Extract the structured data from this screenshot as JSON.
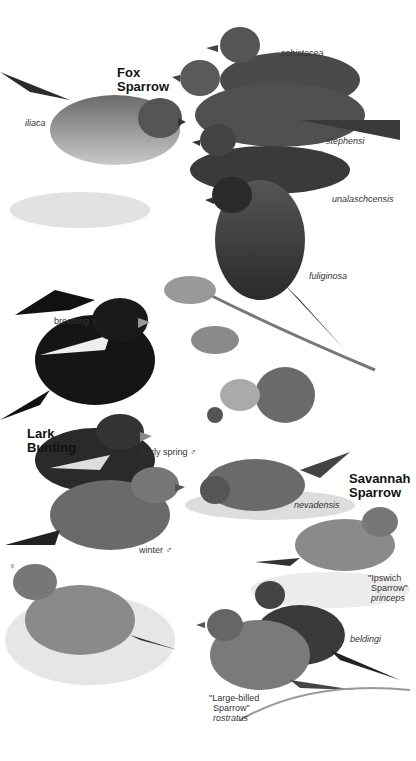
{
  "species": [
    {
      "name_line1": "Fox",
      "name_line2": "Sparrow",
      "subspecies": [
        "iliaca",
        "schistacea",
        "stephensi",
        "unalaschcensis",
        "fuliginosa"
      ]
    },
    {
      "name_line1": "Lark",
      "name_line2": "Bunting",
      "plumages": [
        "breeding ♂",
        "early spring ♂",
        "winter ♂",
        "♀"
      ]
    },
    {
      "name_line1": "Savannah",
      "name_line2": "Sparrow",
      "subspecies": [
        "nevadensis",
        "beldingi"
      ],
      "ipswich": {
        "line1": "\"Ipswich",
        "line2": "Sparrow\"",
        "line3": "princeps"
      },
      "largebilled": {
        "line1": "\"Large-billed",
        "line2": "Sparrow\"",
        "line3": "rostratus"
      }
    }
  ],
  "colors": {
    "background": "#ffffff",
    "ink": "#1a1a1a"
  }
}
